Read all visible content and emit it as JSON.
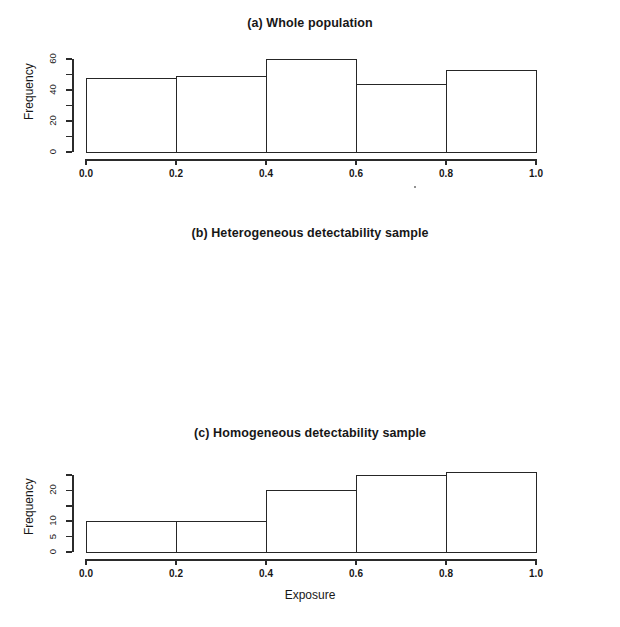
{
  "figure": {
    "xlabel": "Exposure",
    "ylabel": "Frequency"
  },
  "panels": [
    {
      "id": "a",
      "title": "(a) Whole population",
      "ylabel": "Frequency",
      "ytick_labels": [
        "0",
        "20",
        "40",
        "60"
      ],
      "xtick_labels": [
        "0.0",
        "0.2",
        "0.4",
        "0.6",
        "0.8",
        "1.0"
      ]
    },
    {
      "id": "b",
      "title": "(b) Heterogeneous detectability sample",
      "ylabel": "Frequency",
      "ytick_labels": [
        "0",
        "5",
        "10",
        "20"
      ],
      "xtick_labels": [
        "0.0",
        "0.2",
        "0.4",
        "0.6",
        "0.8",
        "1.0"
      ]
    },
    {
      "id": "c",
      "title": "(c) Homogeneous detectability sample",
      "ylabel": "Frequency",
      "ytick_labels": [
        "0",
        "5",
        "10",
        "15",
        "20"
      ],
      "xtick_labels": [
        "0.0",
        "0.2",
        "0.4",
        "0.6",
        "0.8",
        "1.0"
      ]
    }
  ],
  "chart_data": [
    {
      "type": "bar",
      "title": "(a) Whole population",
      "xlabel": "",
      "ylabel": "Frequency",
      "categories": [
        "0.0-0.2",
        "0.2-0.4",
        "0.4-0.6",
        "0.6-0.8",
        "0.8-1.0"
      ],
      "bin_edges": [
        0.0,
        0.2,
        0.4,
        0.6,
        0.8,
        1.0
      ],
      "values": [
        48,
        49,
        60,
        44,
        53
      ],
      "xlim": [
        0.0,
        1.0
      ],
      "ylim": [
        0,
        60
      ],
      "yticks": [
        0,
        10,
        20,
        30,
        40,
        50,
        60
      ],
      "ytick_labels_shown": [
        0,
        20,
        40,
        60
      ],
      "xticks": [
        0.0,
        0.2,
        0.4,
        0.6,
        0.8,
        1.0
      ],
      "grid": false,
      "legend": false
    },
    {
      "type": "bar",
      "title": "(b) Heterogeneous detectability sample",
      "xlabel": "",
      "ylabel": "Frequency",
      "categories": [
        "0.0-0.2",
        "0.2-0.4",
        "0.4-0.6",
        "0.6-0.8",
        "0.8-1.0"
      ],
      "bin_edges": [
        0.0,
        0.2,
        0.4,
        0.6,
        0.8,
        1.0
      ],
      "values": [
        10,
        10,
        20,
        25,
        26
      ],
      "xlim": [
        0.0,
        1.0
      ],
      "ylim": [
        0,
        26
      ],
      "yticks": [
        0,
        5,
        10,
        15,
        20,
        25
      ],
      "ytick_labels_shown": [
        0,
        5,
        10,
        20
      ],
      "xticks": [
        0.0,
        0.2,
        0.4,
        0.6,
        0.8,
        1.0
      ],
      "grid": false,
      "legend": false
    },
    {
      "type": "bar",
      "title": "(c) Homogeneous detectability sample",
      "xlabel": "Exposure",
      "ylabel": "Frequency",
      "categories": [
        "0.0-0.2",
        "0.2-0.4",
        "0.4-0.6",
        "0.6-0.8",
        "0.8-1.0"
      ],
      "bin_edges": [
        0.0,
        0.2,
        0.4,
        0.6,
        0.8,
        1.0
      ],
      "values": [
        15,
        16,
        22,
        17,
        20
      ],
      "xlim": [
        0.0,
        1.0
      ],
      "ylim": [
        0,
        22
      ],
      "yticks": [
        0,
        5,
        10,
        15,
        20
      ],
      "ytick_labels_shown": [
        0,
        5,
        10,
        15,
        20
      ],
      "xticks": [
        0.0,
        0.2,
        0.4,
        0.6,
        0.8,
        1.0
      ],
      "grid": false,
      "legend": false
    }
  ]
}
